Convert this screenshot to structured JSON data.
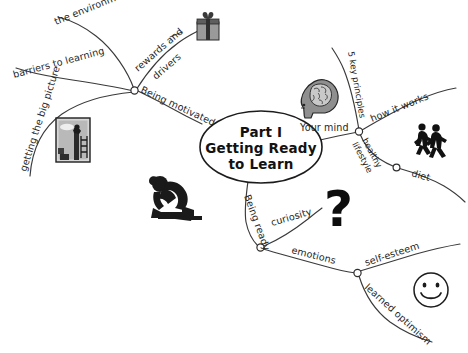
{
  "diagram": {
    "style": "hand-drawn black and white mind map",
    "background_color": "#ffffff",
    "line_color": "#3a3a3a",
    "text_color": "#1f1f1f"
  },
  "center": {
    "line1": "Part I",
    "line2": "Getting Ready",
    "line3": "to Learn"
  },
  "branches": {
    "being_motivated": {
      "label": "Being motivated",
      "children": [
        {
          "label": "the environment"
        },
        {
          "label": "rewards and"
        },
        {
          "label": "drivers"
        },
        {
          "label": "barriers to learning"
        },
        {
          "label": "getting the big picture"
        }
      ]
    },
    "your_mind": {
      "label": "Your mind",
      "children": [
        {
          "label": "5 key principles"
        },
        {
          "label": "how it works"
        },
        {
          "label": "healthy"
        },
        {
          "label": "lifestyle"
        },
        {
          "label": "diet"
        }
      ]
    },
    "being_ready": {
      "label": "Being ready",
      "children": [
        {
          "label": "curiosity"
        },
        {
          "label": "emotions"
        },
        {
          "label": "self-esteem"
        },
        {
          "label": "learned optimism"
        }
      ]
    }
  },
  "icons": {
    "gift": "gift-box-icon",
    "ladder_picture": "framed-picture-icon",
    "brain_head": "brain-head-icon",
    "runners": "runners-icon",
    "sprinter": "sprinter-start-icon",
    "question_mark": "question-mark-icon",
    "smiley": "smiley-face-icon"
  }
}
